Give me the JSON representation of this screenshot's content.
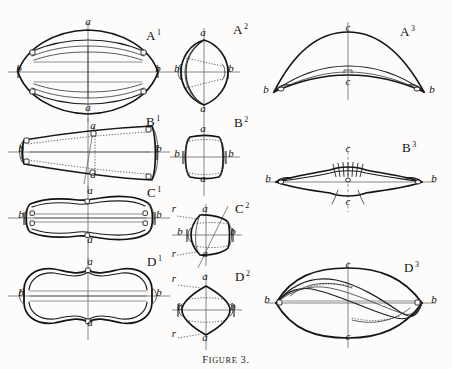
{
  "plate": {
    "caption_small_caps": "Figure",
    "caption_number": "3.",
    "background": "#fdfcfa",
    "ink": "#1b1b1b",
    "width": 452,
    "height": 369
  },
  "panels": [
    {
      "id": "A1",
      "letter": "A",
      "exponent": "1",
      "view": "dorsal",
      "label_x": 146,
      "label_y": 40,
      "axis_labels": [
        {
          "text": "a",
          "x": 88,
          "y": 25
        },
        {
          "text": "a",
          "x": 88,
          "y": 111
        },
        {
          "text": "b",
          "x": 19,
          "y": 72
        },
        {
          "text": "b",
          "x": 158,
          "y": 72
        }
      ]
    },
    {
      "id": "A2",
      "letter": "A",
      "exponent": "2",
      "view": "anterior",
      "label_x": 233,
      "label_y": 34,
      "axis_labels": [
        {
          "text": "a",
          "x": 203,
          "y": 36
        },
        {
          "text": "a",
          "x": 203,
          "y": 112
        },
        {
          "text": "b",
          "x": 177,
          "y": 72
        },
        {
          "text": "b",
          "x": 231,
          "y": 72
        }
      ]
    },
    {
      "id": "A3",
      "letter": "A",
      "exponent": "3",
      "view": "lateral",
      "label_x": 400,
      "label_y": 36,
      "axis_labels": [
        {
          "text": "c",
          "x": 348,
          "y": 31
        },
        {
          "text": "c",
          "x": 348,
          "y": 85
        },
        {
          "text": "b",
          "x": 266,
          "y": 93
        },
        {
          "text": "b",
          "x": 432,
          "y": 93
        }
      ]
    },
    {
      "id": "B1",
      "letter": "B",
      "exponent": "1",
      "view": "dorsal",
      "label_x": 146,
      "label_y": 126,
      "axis_labels": [
        {
          "text": "a",
          "x": 93,
          "y": 129
        },
        {
          "text": "a",
          "x": 93,
          "y": 178
        },
        {
          "text": "b",
          "x": 21,
          "y": 152
        },
        {
          "text": "b",
          "x": 159,
          "y": 152
        }
      ]
    },
    {
      "id": "B2",
      "letter": "B",
      "exponent": "2",
      "view": "anterior",
      "label_x": 234,
      "label_y": 127,
      "axis_labels": [
        {
          "text": "a",
          "x": 203,
          "y": 132
        },
        {
          "text": "a",
          "x": 203,
          "y": 182
        },
        {
          "text": "b",
          "x": 177,
          "y": 157
        },
        {
          "text": "b",
          "x": 231,
          "y": 157
        }
      ]
    },
    {
      "id": "B3",
      "letter": "B",
      "exponent": "3",
      "view": "lateral",
      "label_x": 402,
      "label_y": 152,
      "axis_labels": [
        {
          "text": "c",
          "x": 348,
          "y": 152
        },
        {
          "text": "c",
          "x": 348,
          "y": 205
        },
        {
          "text": "b",
          "x": 268,
          "y": 182
        },
        {
          "text": "b",
          "x": 434,
          "y": 182
        }
      ]
    },
    {
      "id": "C1",
      "letter": "C",
      "exponent": "1",
      "view": "dorsal",
      "label_x": 147,
      "label_y": 197,
      "axis_labels": [
        {
          "text": "a",
          "x": 90,
          "y": 194
        },
        {
          "text": "a",
          "x": 90,
          "y": 243
        },
        {
          "text": "b",
          "x": 21,
          "y": 218
        },
        {
          "text": "b",
          "x": 159,
          "y": 218
        }
      ]
    },
    {
      "id": "C2",
      "letter": "C",
      "exponent": "2",
      "view": "anterior",
      "label_x": 235,
      "label_y": 213,
      "axis_labels": [
        {
          "text": "a",
          "x": 205,
          "y": 212
        },
        {
          "text": "a",
          "x": 205,
          "y": 257
        },
        {
          "text": "b",
          "x": 180,
          "y": 235
        },
        {
          "text": "b",
          "x": 233,
          "y": 235
        },
        {
          "text": "r",
          "x": 174,
          "y": 212
        },
        {
          "text": "r",
          "x": 174,
          "y": 257
        }
      ]
    },
    {
      "id": "D1",
      "letter": "D",
      "exponent": "1",
      "view": "dorsal",
      "label_x": 147,
      "label_y": 266,
      "axis_labels": [
        {
          "text": "a",
          "x": 90,
          "y": 265
        },
        {
          "text": "a",
          "x": 90,
          "y": 326
        },
        {
          "text": "b",
          "x": 21,
          "y": 296
        },
        {
          "text": "b",
          "x": 159,
          "y": 296
        }
      ]
    },
    {
      "id": "D2",
      "letter": "D",
      "exponent": "2",
      "view": "anterior",
      "label_x": 235,
      "label_y": 281,
      "axis_labels": [
        {
          "text": "a",
          "x": 205,
          "y": 280
        },
        {
          "text": "a",
          "x": 205,
          "y": 341
        },
        {
          "text": "b",
          "x": 180,
          "y": 310
        },
        {
          "text": "b",
          "x": 233,
          "y": 310
        },
        {
          "text": "r",
          "x": 174,
          "y": 282
        },
        {
          "text": "r",
          "x": 174,
          "y": 337
        }
      ]
    },
    {
      "id": "D3",
      "letter": "D",
      "exponent": "3",
      "view": "lateral",
      "label_x": 404,
      "label_y": 272,
      "axis_labels": [
        {
          "text": "c",
          "x": 348,
          "y": 268
        },
        {
          "text": "c",
          "x": 348,
          "y": 340
        },
        {
          "text": "b",
          "x": 267,
          "y": 303
        },
        {
          "text": "b",
          "x": 434,
          "y": 303
        }
      ]
    }
  ]
}
